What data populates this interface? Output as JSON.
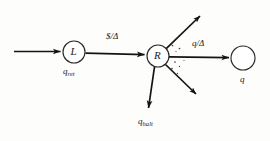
{
  "figure": {
    "type": "state-transition-diagram",
    "background_color": "#fdfdfc",
    "stroke_color": "#141414",
    "nodes": [
      {
        "id": "L",
        "inner_label": "L",
        "state_label": "q",
        "state_subscript": "ret",
        "cx": 74,
        "cy": 52,
        "r": 11
      },
      {
        "id": "R",
        "inner_label": "R",
        "state_label": "",
        "state_subscript": "",
        "cx": 158,
        "cy": 56,
        "r": 11
      },
      {
        "id": "q",
        "inner_label": "",
        "state_label": "q",
        "state_subscript": "",
        "cx": 243,
        "cy": 58,
        "r": 12
      }
    ],
    "edges": [
      {
        "id": "start-to-L",
        "label": "",
        "from": "start",
        "to": "L"
      },
      {
        "id": "L-to-R",
        "label": "$/Δ",
        "read_symbol": "$",
        "write_symbol": "Δ",
        "from": "L",
        "to": "R"
      },
      {
        "id": "R-to-q",
        "label": "q/Δ",
        "read_symbol": "q",
        "write_symbol": "Δ",
        "from": "R",
        "to": "q"
      },
      {
        "id": "R-up-right",
        "label": "",
        "from": "R",
        "to": "unlabeled"
      },
      {
        "id": "R-down-right",
        "label": "",
        "from": "R",
        "to": "unlabeled"
      },
      {
        "id": "R-to-halt",
        "label": "",
        "from": "R",
        "to": "q-halt"
      }
    ],
    "halt_label": "q",
    "halt_subscript": "halt",
    "ellipsis_marks": "· · ·"
  }
}
